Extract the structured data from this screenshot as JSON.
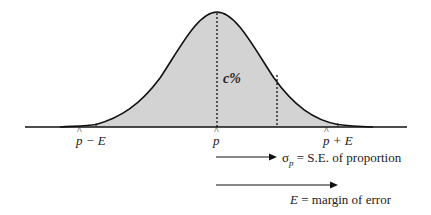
{
  "diagram": {
    "type": "normal-curve",
    "shade_color": "#d3d3d3",
    "curve_color": "#111111",
    "center_label": "c%",
    "axis_labels": {
      "left": {
        "symbol": "p",
        "suffix": " − E"
      },
      "center": {
        "symbol": "p",
        "suffix": ""
      },
      "right": {
        "symbol": "p",
        "suffix": " + E"
      }
    },
    "legend": [
      {
        "arrow": "sigma-arrow",
        "symbol": "σ",
        "subscript": "p",
        "text": " = S.E. of proportion"
      },
      {
        "arrow": "margin-arrow",
        "symbol": "E",
        "text": " = margin of error"
      }
    ]
  }
}
